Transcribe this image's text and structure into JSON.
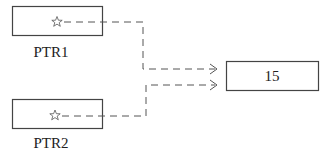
{
  "diagram": {
    "pointers": [
      {
        "label": "PTR1",
        "content_icon": "star-icon",
        "points_to": "value"
      },
      {
        "label": "PTR2",
        "content_icon": "star-icon",
        "points_to": "value"
      }
    ],
    "target": {
      "value": "15"
    },
    "edges": [
      {
        "from": "PTR1",
        "to": "target",
        "style": "dashed",
        "arrow": "open-chevron"
      },
      {
        "from": "PTR2",
        "to": "target",
        "style": "dashed",
        "arrow": "open-chevron"
      }
    ],
    "colors": {
      "stroke": "#444444",
      "dash": "#555555",
      "text": "#222222",
      "background": "#ffffff"
    }
  }
}
